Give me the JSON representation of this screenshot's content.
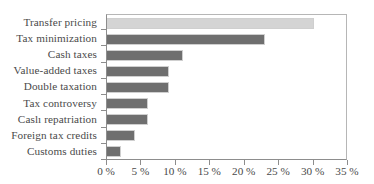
{
  "chart_data": {
    "type": "bar",
    "orientation": "horizontal",
    "title": "",
    "xlabel": "",
    "ylabel": "",
    "categories": [
      "Transfer pricing",
      "Tax minimization",
      "Cash taxes",
      "Value-added taxes",
      "Double taxation",
      "Tax controversy",
      "Caslı repatriation",
      "Foreign tax credits",
      "Customs duties"
    ],
    "values": [
      30,
      23,
      11,
      9,
      9,
      6,
      6,
      4,
      2
    ],
    "value_unit": "%",
    "xlim": [
      0,
      35
    ],
    "xticks": [
      0,
      5,
      10,
      15,
      20,
      25,
      30,
      35
    ],
    "xtick_labels": [
      "0 %",
      "5 %",
      "10 %",
      "15 %",
      "20 %",
      "25 %",
      "30 %",
      "35 %"
    ],
    "grid": false,
    "legend": "none",
    "bar_colors": [
      "#d4d4d4",
      "#6f6f6f",
      "#6f6f6f",
      "#6f6f6f",
      "#6f6f6f",
      "#6f6f6f",
      "#6f6f6f",
      "#6f6f6f",
      "#6f6f6f"
    ],
    "bar_border_color": "#cfcfcf",
    "axis_color": "#8d8d8d",
    "text_color": "#4a4a4a"
  }
}
